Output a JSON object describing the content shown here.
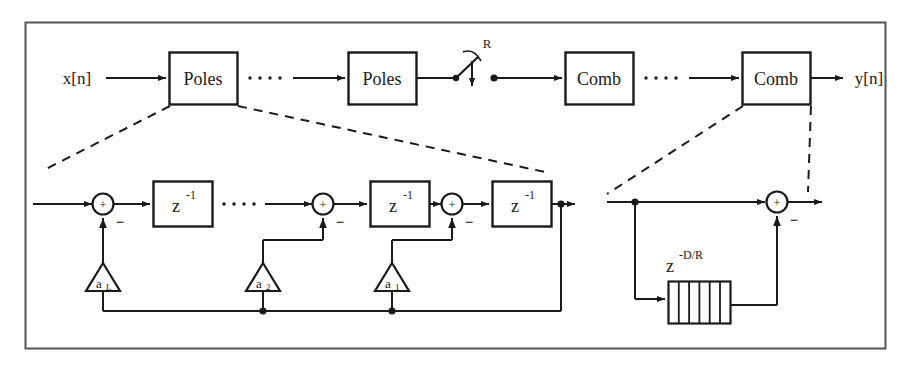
{
  "figure": {
    "frame_color": "#555555",
    "line_color": "#1a1a1a",
    "background": "#ffffff"
  },
  "top_chain": {
    "input_label": "x[n]",
    "output_label": "y[n]",
    "blocks": [
      {
        "label": "Poles"
      },
      {
        "label": "Poles"
      },
      {
        "label": "Comb"
      },
      {
        "label": "Comb"
      }
    ],
    "ellipsis_dots": "4",
    "downsampler": {
      "rate_label": "R"
    }
  },
  "poles_expansion": {
    "delay_label_base": "z",
    "delay_label_exponent": "-1",
    "adders": [
      {
        "plus": "+",
        "minus": "−"
      },
      {
        "plus": "+",
        "minus": "−"
      },
      {
        "plus": "+",
        "minus": "−"
      }
    ],
    "coefficients": [
      {
        "base": "a",
        "subscript": "L"
      },
      {
        "base": "a",
        "subscript": "2"
      },
      {
        "base": "a",
        "subscript": "1"
      }
    ],
    "ellipsis_dots": "4"
  },
  "comb_expansion": {
    "delay_label_base": "z",
    "delay_label_exponent": "-D/R",
    "adder": {
      "plus": "+",
      "minus": "−"
    },
    "delay_line_cells": "6"
  }
}
